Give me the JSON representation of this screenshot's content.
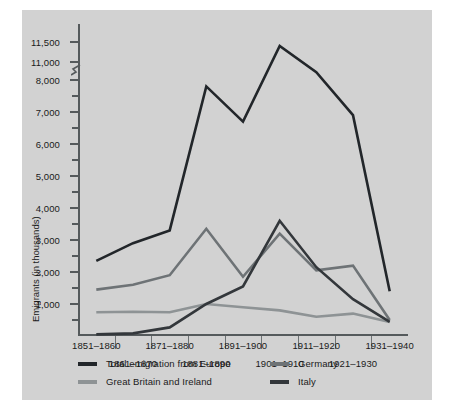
{
  "chart_data": {
    "type": "line",
    "title": "",
    "subtitle": "",
    "xlabel": "",
    "ylabel": "Emigrants (in thousands)",
    "grid": false,
    "legend_position": "bottom-left",
    "axis_break": {
      "present": true,
      "between": [
        8000,
        11000
      ],
      "note": "y-axis compressed between 8,000 and 11,000"
    },
    "ylim": [
      0,
      11500
    ],
    "ytick_labels": [
      "11,500",
      "11,000",
      "8,000",
      "7,000",
      "6,000",
      "5,000",
      "4,000",
      "3,000",
      "2,000",
      "1,000"
    ],
    "ytick_values": [
      11500,
      11000,
      8000,
      7000,
      6000,
      5000,
      4000,
      3000,
      2000,
      1000
    ],
    "categories": [
      "1851–1860",
      "1861–1870",
      "1871–1880",
      "1881–1890",
      "1891–1900",
      "1901–1910",
      "1911–1920",
      "1921–1930",
      "1931–1940"
    ],
    "series": [
      {
        "name": "Total emigration from Europe",
        "color": "#22262a",
        "values": [
          2350,
          2900,
          3300,
          7800,
          6700,
          11400,
          9300,
          6900,
          1400
        ]
      },
      {
        "name": "Germany",
        "color": "#6e7376",
        "values": [
          1450,
          1600,
          1900,
          3350,
          1850,
          3200,
          2050,
          2200,
          500
        ]
      },
      {
        "name": "Great Britain and Ireland",
        "color": "#8e9395",
        "values": [
          740,
          760,
          740,
          1000,
          900,
          800,
          600,
          700,
          440
        ]
      },
      {
        "name": "Italy",
        "color": "#33373b",
        "values": [
          50,
          80,
          270,
          1000,
          1550,
          3600,
          2150,
          1150,
          440
        ]
      }
    ]
  },
  "legend": {
    "items": [
      {
        "label": "Total emigration from Europe",
        "color": "#22262a"
      },
      {
        "label": "Germany",
        "color": "#6e7376"
      },
      {
        "label": "Great Britain and Ireland",
        "color": "#8e9395"
      },
      {
        "label": "Italy",
        "color": "#33373b"
      }
    ]
  }
}
